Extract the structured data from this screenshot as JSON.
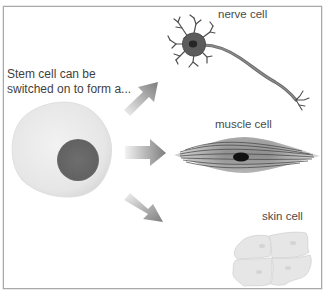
{
  "intro": {
    "line1": "Stem cell can be",
    "line2": "switched on to form a..."
  },
  "cells": [
    {
      "id": "nerve",
      "label": "nerve cell"
    },
    {
      "id": "muscle",
      "label": "muscle cell"
    },
    {
      "id": "skin",
      "label": "skin cell"
    }
  ],
  "colors": {
    "border": "#a9a9a9",
    "stem_cytoplasm": "#ebebeb",
    "stem_nucleus": "#6a6a6a",
    "arrow": "#8c8c8c",
    "neuron": "#5a5a5a",
    "muscle": "#8a8a8a",
    "skin": "#e4e4e4"
  }
}
